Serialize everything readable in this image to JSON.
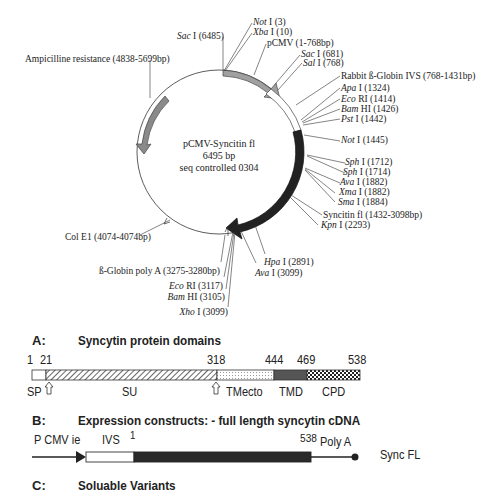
{
  "plasmid_map": {
    "center_label": [
      "pCMV-Syncitin fl",
      "6495 bp",
      "seq controlled 0304"
    ],
    "features": [
      {
        "id": "amp",
        "label": "Ampicilline resistance (4838-5699bp)",
        "color": "#8a8a8a"
      },
      {
        "id": "pcmv",
        "label": "pCMV (1-768bp)",
        "color": "#a0a0a0"
      },
      {
        "id": "ivs",
        "label": "Rabbit ß-Globin IVS (768-1431bp)",
        "color": "#ffffff"
      },
      {
        "id": "syncitin",
        "label": "Syncitin fl (1432-3098bp)",
        "color": "#2a2a2a"
      },
      {
        "id": "polya",
        "label": "ß-Globin poly A (3275-3280bp)"
      },
      {
        "id": "cole1",
        "label": "Col E1 (4074-4074bp)"
      }
    ],
    "sites": [
      {
        "enzyme": "Sac",
        "num": "I",
        "pos": "(6485)"
      },
      {
        "enzyme": "Not",
        "num": "I",
        "pos": "(3)"
      },
      {
        "enzyme": "Xba",
        "num": "I",
        "pos": "(10)"
      },
      {
        "enzyme": "Sac",
        "num": "I",
        "pos": "(681)"
      },
      {
        "enzyme": "Sal",
        "num": "I",
        "pos": "(768)"
      },
      {
        "enzyme": "Apa",
        "num": "I",
        "pos": "(1324)"
      },
      {
        "enzyme": "Eco",
        "num": "RI",
        "pos": "(1414)"
      },
      {
        "enzyme": "Bam",
        "num": "HI",
        "pos": "(1426)"
      },
      {
        "enzyme": "Pst",
        "num": "I",
        "pos": "(1442)"
      },
      {
        "enzyme": "Not",
        "num": "I",
        "pos": "(1445)"
      },
      {
        "enzyme": "Sph",
        "num": "I",
        "pos": "(1712)"
      },
      {
        "enzyme": "Sph",
        "num": "I",
        "pos": "(1714)"
      },
      {
        "enzyme": "Ava",
        "num": "I",
        "pos": "(1882)"
      },
      {
        "enzyme": "Xma",
        "num": "I",
        "pos": "(1882)"
      },
      {
        "enzyme": "Sma",
        "num": "I",
        "pos": "(1884)"
      },
      {
        "enzyme": "Kpn",
        "num": "I",
        "pos": "(2293)"
      },
      {
        "enzyme": "Hpa",
        "num": "I",
        "pos": "(2891)"
      },
      {
        "enzyme": "Ava",
        "num": "I",
        "pos": "(3099)"
      },
      {
        "enzyme": "Eco",
        "num": "RI",
        "pos": "(3117)"
      },
      {
        "enzyme": "Bam",
        "num": "HI",
        "pos": "(3105)"
      },
      {
        "enzyme": "Xho",
        "num": "I",
        "pos": "(3099)"
      }
    ]
  },
  "section_a": {
    "letter": "A:",
    "title": "Syncytin protein domains",
    "positions": [
      "1",
      "21",
      "318",
      "444",
      "469",
      "538"
    ],
    "domains": [
      "SP",
      "SU",
      "TMecto",
      "TMD",
      "CPD"
    ]
  },
  "section_b": {
    "letter": "B:",
    "title": "Expression constructs: - full length syncytin cDNA",
    "promoter": "P CMV ie",
    "intron": "IVS",
    "start": "1",
    "end": "538",
    "polya": "Poly A",
    "construct_name": "Sync FL"
  },
  "section_c": {
    "letter": "C:",
    "title": "Soluable Variants"
  }
}
